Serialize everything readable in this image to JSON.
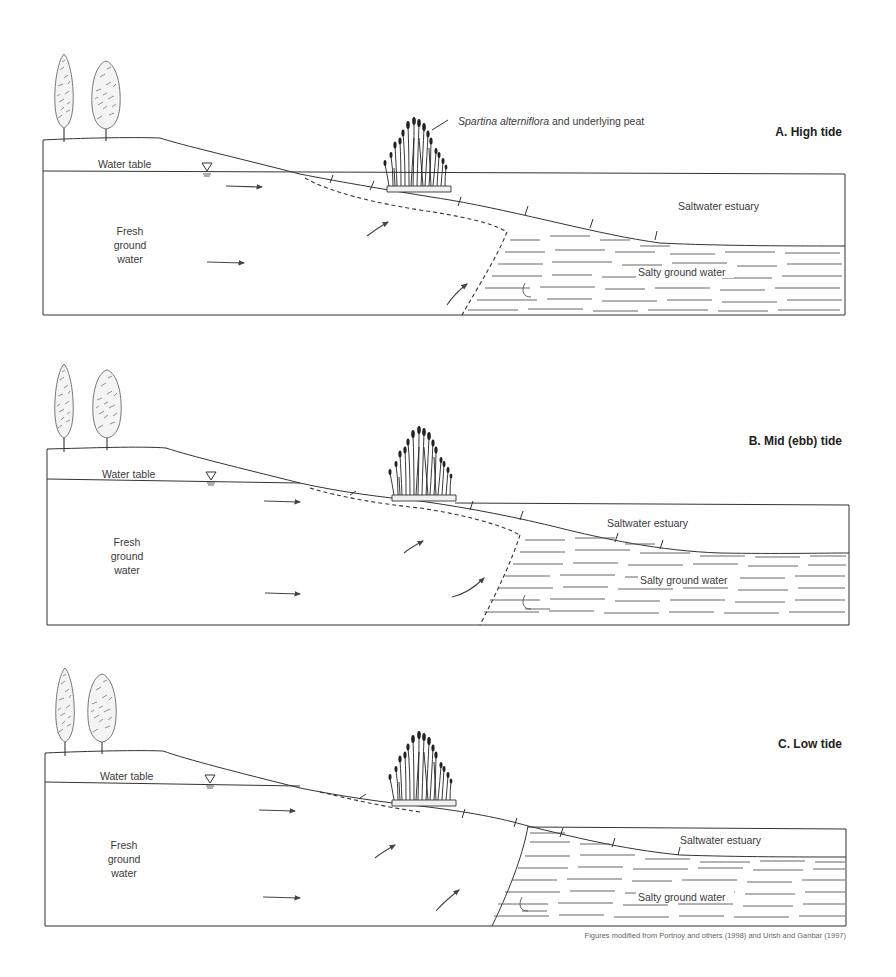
{
  "figure": {
    "caption": "Figures modified from Portnoy and others (1998) and Urish and Ganbar (1997)",
    "annotation": {
      "species": "Spartina alterniflora",
      "rest": " and underlying peat"
    },
    "panels": [
      {
        "id": "A",
        "title": "A. High tide",
        "labels": {
          "water_table": "Water table",
          "fresh_line1": "Fresh",
          "fresh_line2": "ground",
          "fresh_line3": "water",
          "estuary": "Saltwater estuary",
          "salty": "Salty ground water"
        }
      },
      {
        "id": "B",
        "title": "B. Mid (ebb) tide",
        "labels": {
          "water_table": "Water table",
          "fresh_line1": "Fresh",
          "fresh_line2": "ground",
          "fresh_line3": "water",
          "estuary": "Saltwater estuary",
          "salty": "Salty ground water"
        }
      },
      {
        "id": "C",
        "title": "C. Low tide",
        "labels": {
          "water_table": "Water table",
          "fresh_line1": "Fresh",
          "fresh_line2": "ground",
          "fresh_line3": "water",
          "estuary": "Saltwater estuary",
          "salty": "Salty ground water"
        }
      }
    ],
    "icons": {
      "water_table_symbol": "inverted-triangle"
    }
  }
}
